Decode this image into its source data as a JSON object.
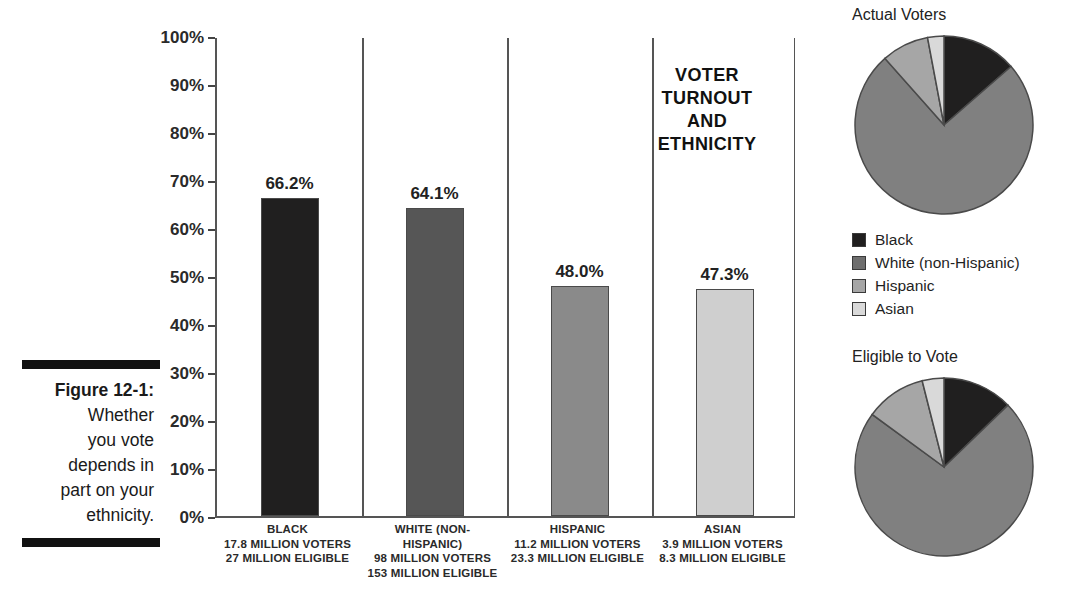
{
  "caption": {
    "figure_label": "Figure 12-1:",
    "text": "Whether you vote depends in part on your ethnicity.",
    "line1": "Figure 12-1:",
    "line2": "Whether",
    "line3": "you vote",
    "line4": "depends in",
    "line5": "part on your",
    "line6": "ethnicity."
  },
  "chart_data": {
    "type": "bar",
    "title_lines": [
      "VOTER",
      "TURNOUT",
      "AND",
      "ETHNICITY"
    ],
    "xlabel": "",
    "ylabel": "",
    "ylim": [
      0,
      100
    ],
    "ytick_labels": [
      "100%",
      "90%",
      "80%",
      "70%",
      "60%",
      "50%",
      "40%",
      "30%",
      "20%",
      "10%",
      "0%"
    ],
    "ytick_values": [
      100,
      90,
      80,
      70,
      60,
      50,
      40,
      30,
      20,
      10,
      0
    ],
    "grid": false,
    "categories": [
      "BLACK",
      "WHITE (NON-HISPANIC)",
      "HISPANIC",
      "ASIAN"
    ],
    "values": [
      66.2,
      64.1,
      48.0,
      47.3
    ],
    "value_labels": [
      "66.2%",
      "64.1%",
      "48.0%",
      "47.3%"
    ],
    "bar_colors": [
      "#201f1f",
      "#565656",
      "#8a8a8a",
      "#cfcfcf"
    ],
    "category_details": [
      {
        "name_lines": [
          "BLACK"
        ],
        "voters": "17.8 MILLION VOTERS",
        "eligible": "27 MILLION ELIGIBLE",
        "voters_millions": 17.8,
        "eligible_millions": 27
      },
      {
        "name_lines": [
          "WHITE (NON-",
          "HISPANIC)"
        ],
        "voters": "98 MILLION VOTERS",
        "eligible": "153 MILLION ELIGIBLE",
        "voters_millions": 98,
        "eligible_millions": 153
      },
      {
        "name_lines": [
          "HISPANIC"
        ],
        "voters": "11.2 MILLION VOTERS",
        "eligible": "23.3 MILLION ELIGIBLE",
        "voters_millions": 11.2,
        "eligible_millions": 23.3
      },
      {
        "name_lines": [
          "ASIAN"
        ],
        "voters": "3.9 MILLION VOTERS",
        "eligible": "8.3 MILLION ELIGIBLE",
        "voters_millions": 3.9,
        "eligible_millions": 8.3
      }
    ],
    "pies": [
      {
        "title": "Actual Voters",
        "labels": [
          "Black",
          "White (non-Hispanic)",
          "Hispanic",
          "Asian"
        ],
        "values": [
          13.3,
          73.3,
          8.4,
          2.9
        ],
        "colors": [
          "#201f1f",
          "#808080",
          "#a6a6a6",
          "#d9d9d9"
        ]
      },
      {
        "title": "Eligible to Vote",
        "labels": [
          "Black",
          "White (non-Hispanic)",
          "Hispanic",
          "Asian"
        ],
        "values": [
          12.3,
          69.6,
          10.6,
          3.8
        ],
        "colors": [
          "#201f1f",
          "#808080",
          "#a6a6a6",
          "#d9d9d9"
        ]
      }
    ],
    "legend": {
      "position": "right-middle",
      "entries": [
        {
          "label": "Black",
          "color": "#201f1f"
        },
        {
          "label": "White (non-Hispanic)",
          "color": "#6e6e6e"
        },
        {
          "label": "Hispanic",
          "color": "#a6a6a6"
        },
        {
          "label": "Asian",
          "color": "#d9d9d9"
        }
      ]
    }
  }
}
